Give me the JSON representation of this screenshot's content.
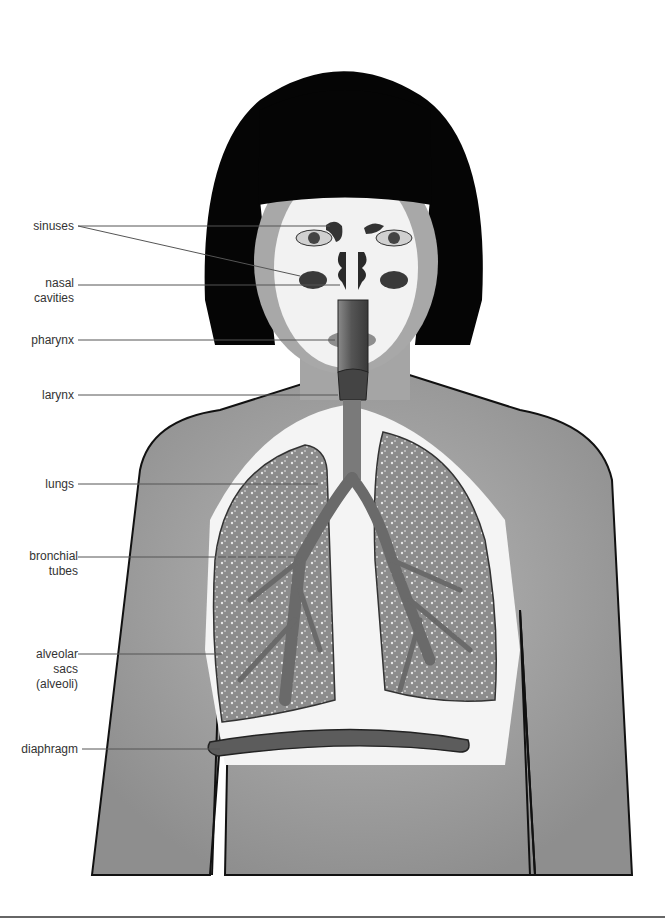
{
  "diagram": {
    "labels": [
      {
        "id": "sinuses",
        "lines": [
          "sinuses"
        ]
      },
      {
        "id": "nasal-cavities",
        "lines": [
          "nasal",
          "cavities"
        ]
      },
      {
        "id": "pharynx",
        "lines": [
          "pharynx"
        ]
      },
      {
        "id": "larynx",
        "lines": [
          "larynx"
        ]
      },
      {
        "id": "lungs",
        "lines": [
          "lungs"
        ]
      },
      {
        "id": "bronchial-tubes",
        "lines": [
          "bronchial",
          "tubes"
        ]
      },
      {
        "id": "alveolar-sacs",
        "lines": [
          "alveolar",
          "sacs",
          "(alveoli)"
        ]
      },
      {
        "id": "diaphragm",
        "lines": [
          "diaphragm"
        ]
      }
    ],
    "colors": {
      "hair": "#050505",
      "skin": "#9a9a9a",
      "skin_light": "#b5b5b5",
      "cavity_bg": "#f4f4f4",
      "lung": "#8a8a8a",
      "airway": "#6e6e6e",
      "diaphragm": "#5a5a5a",
      "leader_line": "#555555",
      "label_text": "#333333"
    }
  }
}
